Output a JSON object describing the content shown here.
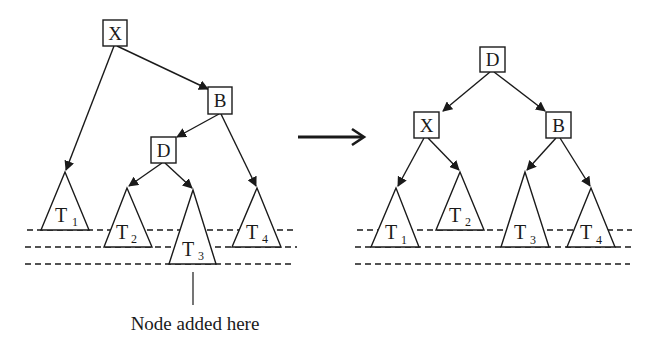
{
  "diagram": {
    "type": "avl-tree-rotation",
    "before": {
      "nodes": [
        {
          "id": "X",
          "label": "X",
          "x": 115,
          "y": 33
        },
        {
          "id": "B",
          "label": "B",
          "x": 220,
          "y": 100
        },
        {
          "id": "D",
          "label": "D",
          "x": 163,
          "y": 150
        }
      ],
      "subtrees": [
        {
          "label": "T",
          "sub": "1",
          "apex": [
            65,
            172
          ],
          "base_y": 230,
          "half_width": 24
        },
        {
          "label": "T",
          "sub": "2",
          "apex": [
            127,
            188
          ],
          "base_y": 247,
          "half_width": 24
        },
        {
          "label": "T",
          "sub": "3",
          "apex": [
            193,
            190
          ],
          "base_y": 264,
          "half_width": 24
        },
        {
          "label": "T",
          "sub": "4",
          "apex": [
            257,
            188
          ],
          "base_y": 247,
          "half_width": 24
        }
      ],
      "edges": [
        [
          "X",
          "T1"
        ],
        [
          "X",
          "B"
        ],
        [
          "B",
          "D"
        ],
        [
          "B",
          "T4"
        ],
        [
          "D",
          "T2"
        ],
        [
          "D",
          "T3"
        ]
      ],
      "annotation": "Node added here"
    },
    "transition_arrow": "→",
    "after": {
      "nodes": [
        {
          "id": "D",
          "label": "D",
          "x": 492,
          "y": 60
        },
        {
          "id": "X",
          "label": "X",
          "x": 426,
          "y": 125
        },
        {
          "id": "B",
          "label": "B",
          "x": 558,
          "y": 125
        }
      ],
      "subtrees": [
        {
          "label": "T",
          "sub": "1",
          "apex": [
            396,
            188
          ],
          "base_y": 247,
          "half_width": 24
        },
        {
          "label": "T",
          "sub": "2",
          "apex": [
            460,
            172
          ],
          "base_y": 230,
          "half_width": 24
        },
        {
          "label": "T",
          "sub": "3",
          "apex": [
            525,
            172
          ],
          "base_y": 247,
          "half_width": 24
        },
        {
          "label": "T",
          "sub": "4",
          "apex": [
            591,
            188
          ],
          "base_y": 247,
          "half_width": 24
        }
      ],
      "edges": [
        [
          "D",
          "X"
        ],
        [
          "D",
          "B"
        ],
        [
          "X",
          "T1"
        ],
        [
          "X",
          "T2"
        ],
        [
          "B",
          "T3"
        ],
        [
          "B",
          "T4"
        ]
      ]
    },
    "level_lines_y": [
      230,
      247,
      264
    ]
  }
}
